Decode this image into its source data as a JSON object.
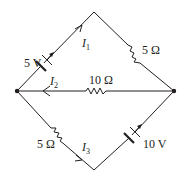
{
  "diagram": {
    "type": "circuit",
    "nodes": {
      "top": {
        "x": 94,
        "y": 12
      },
      "left": {
        "x": 17,
        "y": 91
      },
      "right": {
        "x": 174,
        "y": 91
      },
      "bottom": {
        "x": 94,
        "y": 170
      }
    },
    "branches": [
      {
        "id": "left-top",
        "component": "battery",
        "value": "5 V",
        "current": "I",
        "current_sub": "1"
      },
      {
        "id": "top-right",
        "component": "resistor",
        "value": "5 Ω"
      },
      {
        "id": "right-left",
        "component": "resistor",
        "value": "10 Ω",
        "current": "I",
        "current_sub": "2"
      },
      {
        "id": "left-bottom",
        "component": "resistor",
        "value": "5 Ω",
        "current": "I",
        "current_sub": "3"
      },
      {
        "id": "bottom-right",
        "component": "battery",
        "value": "10 V"
      }
    ]
  },
  "labels": {
    "battery_5v": "5 V",
    "resistor_top_right": "5 Ω",
    "resistor_middle": "10 Ω",
    "resistor_bottom_left": "5 Ω",
    "battery_10v": "10 V",
    "current_1_main": "I",
    "current_1_sub": "1",
    "current_2_main": "I",
    "current_2_sub": "2",
    "current_3_main": "I",
    "current_3_sub": "3"
  },
  "colors": {
    "ink": "#231f20",
    "background": "#ffffff"
  }
}
